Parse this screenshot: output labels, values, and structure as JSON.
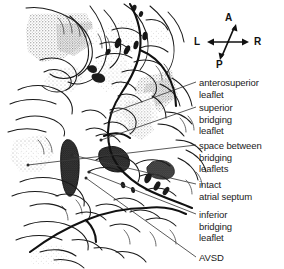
{
  "figure": {
    "background_color": "#ffffff",
    "ink_color": "#1a1a1a",
    "width": 284,
    "height": 269
  },
  "orientation_compass": {
    "name": "orientation-compass",
    "anterior": "A",
    "posterior": "P",
    "left": "L",
    "right": "R"
  },
  "labels": [
    {
      "id": "anterosuperior-leaflet",
      "lines": [
        "anterosuperior",
        "leaflet"
      ]
    },
    {
      "id": "superior-bridging-leaflet",
      "lines": [
        "superior",
        "bridging",
        "leaflet"
      ]
    },
    {
      "id": "space-between-bridging-leaflets",
      "lines": [
        "space between",
        "bridging",
        "leaflets"
      ]
    },
    {
      "id": "intact-atrial-septum",
      "lines": [
        "intact",
        "atrial septum"
      ]
    },
    {
      "id": "inferior-bridging-leaflet",
      "lines": [
        "inferior",
        "bridging",
        "leaflet"
      ]
    },
    {
      "id": "avsd",
      "lines": [
        "AVSD"
      ]
    }
  ]
}
